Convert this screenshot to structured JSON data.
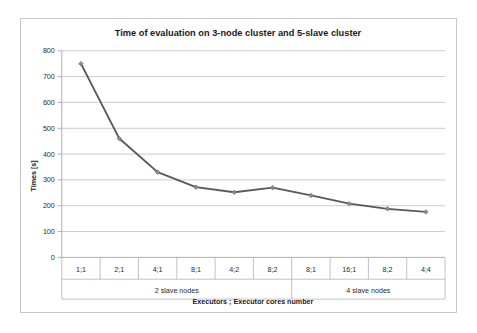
{
  "chart_data": {
    "type": "line",
    "title": "Time of evaluation on 3-node cluster and 5-slave cluster",
    "xlabel": "Executors ; Executor cores number",
    "ylabel": "Times [s]",
    "categories": [
      "1;1",
      "2;1",
      "4;1",
      "8;1",
      "4;2",
      "8;2",
      "8;1",
      "16;1",
      "8;2",
      "4;4"
    ],
    "values": [
      750,
      460,
      330,
      272,
      252,
      270,
      240,
      208,
      188,
      176
    ],
    "ylim": [
      0,
      800
    ],
    "ytick_step": 100,
    "yticks": [
      "800",
      "700",
      "600",
      "500",
      "400",
      "300",
      "200",
      "100",
      "0"
    ],
    "grid": true,
    "legend": "none",
    "series": [
      {
        "name": "Time of evaluation",
        "values": [
          750,
          460,
          330,
          272,
          252,
          270,
          240,
          208,
          188,
          176
        ]
      }
    ],
    "group_labels": [
      {
        "label": "2 slave nodes",
        "start_index": 0,
        "end_index": 5
      },
      {
        "label": "4 slave nodes",
        "start_index": 6,
        "end_index": 9
      }
    ],
    "colors": {
      "line": "#595959",
      "marker": "#8c8c8c",
      "grid": "#b6b6b6",
      "axis": "#9a9a9a",
      "text": "#1a1a1a",
      "background": "#ffffff",
      "border": "#c9c9c9"
    }
  }
}
